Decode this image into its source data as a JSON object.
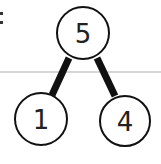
{
  "diagram": {
    "type": "number-bond",
    "whole": {
      "label": "5",
      "cx": 83,
      "cy": 33,
      "r": 26
    },
    "parts": [
      {
        "label": "1",
        "cx": 41,
        "cy": 119,
        "r": 26
      },
      {
        "label": "4",
        "cx": 125,
        "cy": 121,
        "r": 25
      }
    ],
    "edges": [
      {
        "from": "whole",
        "to": 0
      },
      {
        "from": "whole",
        "to": 1
      }
    ],
    "colon_mark": ":",
    "colors": {
      "stroke": "#111111",
      "text": "#222222",
      "rule_line": "#c8c8c8",
      "background": "#ffffff"
    }
  }
}
